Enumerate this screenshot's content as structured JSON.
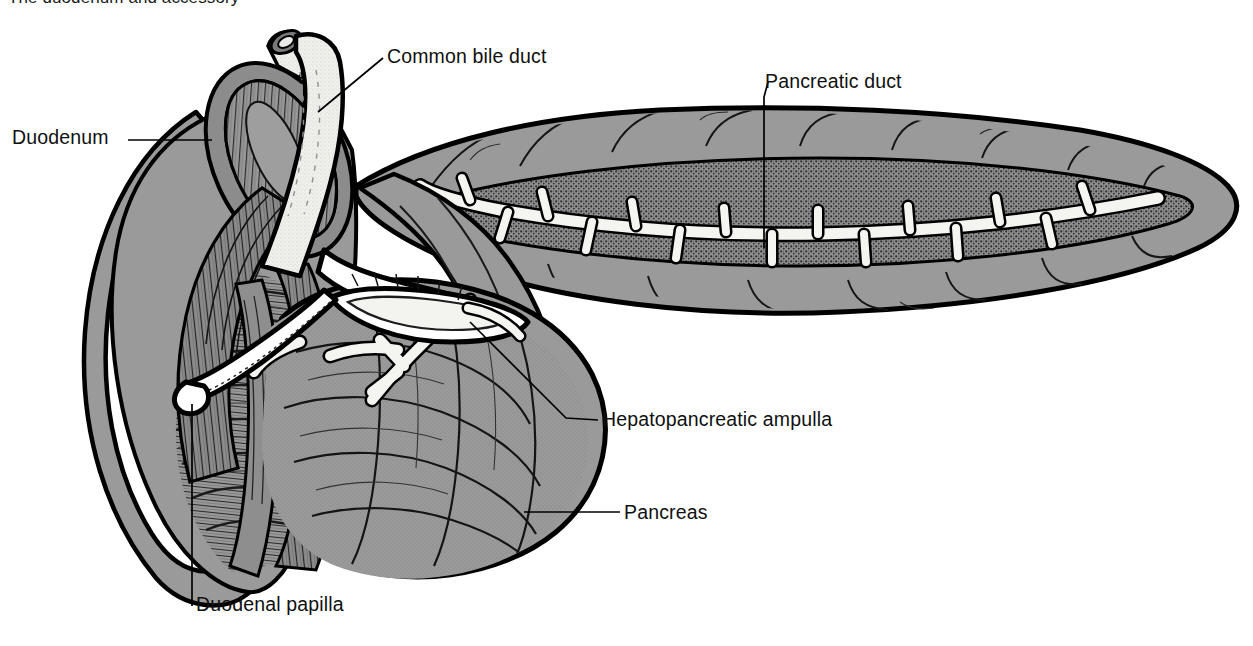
{
  "figure": {
    "caption_fragment": "The duodenum and accessory",
    "background_color": "#ffffff",
    "ink_color": "#000000",
    "organ_fill": "#9a9a9a",
    "duct_fill": "#f2f2f0",
    "lumen_shadow": "#6f6f6f"
  },
  "labels": [
    {
      "id": "common-bile-duct",
      "text": "Common bile duct"
    },
    {
      "id": "pancreatic-duct",
      "text": "Pancreatic duct"
    },
    {
      "id": "duodenum",
      "text": "Duodenum"
    },
    {
      "id": "hepatopancreatic",
      "text": "Hepatopancreatic ampulla"
    },
    {
      "id": "pancreas",
      "text": "Pancreas"
    },
    {
      "id": "duodenal-papilla",
      "text": "Duodenal papilla"
    }
  ]
}
